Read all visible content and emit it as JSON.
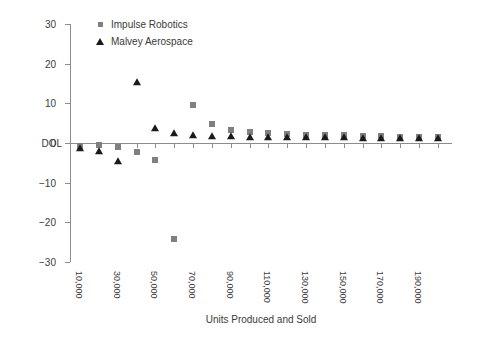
{
  "chart_data": {
    "type": "scatter",
    "title": "",
    "xlabel": "Units Produced and Sold",
    "ylabel": "DOL",
    "ylim": [
      -30,
      30
    ],
    "yticks": [
      30,
      20,
      10,
      0,
      -10,
      -20,
      -30
    ],
    "xlim": [
      10000,
      200000
    ],
    "grid": false,
    "legend_position": "top-left-inside",
    "x": [
      10000,
      20000,
      30000,
      40000,
      50000,
      60000,
      70000,
      80000,
      90000,
      100000,
      110000,
      120000,
      130000,
      140000,
      150000,
      160000,
      170000,
      180000,
      190000,
      200000
    ],
    "xticklabels": [
      "10,000",
      "",
      "30,000",
      "",
      "50,000",
      "",
      "70,000",
      "",
      "90,000",
      "",
      "110,000",
      "",
      "130,000",
      "",
      "150,000",
      "",
      "170,000",
      "",
      "190,000",
      ""
    ],
    "xticklabels_all": [
      "10,000",
      "20,000",
      "30,000",
      "40,000",
      "50,000",
      "60,000",
      "70,000",
      "80,000",
      "90,000",
      "100,000",
      "110,000",
      "120,000",
      "130,000",
      "140,000",
      "150,000",
      "160,000",
      "170,000",
      "180,000",
      "190,000",
      "200,000"
    ],
    "series": [
      {
        "name": "Impulse Robotics",
        "marker": "square",
        "color": "#808080",
        "values": [
          -0.8,
          -0.5,
          -1.0,
          -2.2,
          -4.4,
          -24.1,
          9.5,
          4.8,
          3.3,
          2.8,
          2.5,
          2.3,
          2.1,
          2.0,
          1.9,
          1.8,
          1.7,
          1.6,
          1.6,
          1.5
        ]
      },
      {
        "name": "Malvey Aerospace",
        "marker": "triangle",
        "color": "#1a1a1a",
        "values": [
          -1.2,
          -2.0,
          -4.6,
          15.4,
          3.9,
          2.6,
          2.0,
          1.8,
          1.7,
          1.6,
          1.5,
          1.5,
          1.4,
          1.4,
          1.4,
          1.3,
          1.3,
          1.3,
          1.3,
          1.3
        ]
      }
    ]
  },
  "legend": {
    "items": [
      {
        "label": "Impulse Robotics",
        "marker": "square"
      },
      {
        "label": "Malvey Aerospace",
        "marker": "triangle"
      }
    ]
  },
  "axes": {
    "x_title": "Units Produced and Sold",
    "y_title": "DOL"
  }
}
